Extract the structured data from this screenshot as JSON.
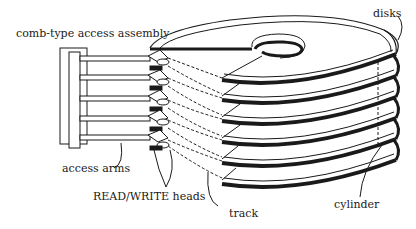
{
  "diagram": {
    "labels": {
      "comb_assembly": "comb-type access assembly",
      "disks": "disks",
      "access_arms": "access arms",
      "read_write_heads": "READ/WRITE heads",
      "track": "track",
      "cylinder": "cylinder"
    },
    "disk_count": 6,
    "arm_count": 5,
    "colors": {
      "ink": "#1a1a1a",
      "background": "#ffffff"
    }
  }
}
